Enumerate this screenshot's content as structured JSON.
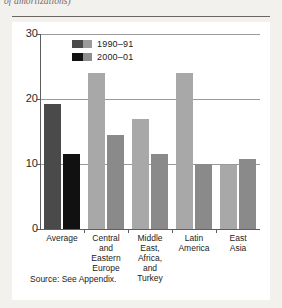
{
  "caption": {
    "clipped_line": "of amortizations)"
  },
  "source_note": "Source: See Appendix.",
  "legend": {
    "items": [
      {
        "label": "1990–91",
        "color_dark": "#4a4a4a",
        "color_light": "#9b9b9b"
      },
      {
        "label": "2000–01",
        "color_dark": "#111111",
        "color_light": "#8e8e8e"
      }
    ]
  },
  "axis": {
    "y_ticks": [
      "30",
      "20",
      "10",
      "0"
    ]
  },
  "chart_data": {
    "type": "bar",
    "title": "",
    "xlabel": "",
    "ylabel": "",
    "ylim": [
      0,
      30
    ],
    "yticks": [
      0,
      10,
      20,
      30
    ],
    "grid": true,
    "legend_position": "top-left-inside",
    "categories": [
      "Average",
      "Central and Eastern Europe",
      "Middle East, Africa, and Turkey",
      "Latin America",
      "East Asia"
    ],
    "category_lines": [
      [
        "Average"
      ],
      [
        "Central",
        "and",
        "Eastern",
        "Europe"
      ],
      [
        "Middle",
        "East,",
        "Africa,",
        "and",
        "Turkey"
      ],
      [
        "Latin",
        "America"
      ],
      [
        "East",
        "Asia"
      ]
    ],
    "series": [
      {
        "name": "1990–91",
        "color": "#4a4a4a",
        "values": [
          19.3,
          24.0,
          17.0,
          24.0,
          9.8
        ]
      },
      {
        "name": "2000–01",
        "color": "#111111",
        "values": [
          11.5,
          14.4,
          11.5,
          10.0,
          10.8
        ]
      }
    ],
    "series_colors_nonaverage": {
      "1990-91": "#a8a8a8",
      "2000-01": "#8a8a8a"
    },
    "note": "Average group is rendered in dark gray / black; the four regional groups are rendered in light gray / medium gray."
  }
}
